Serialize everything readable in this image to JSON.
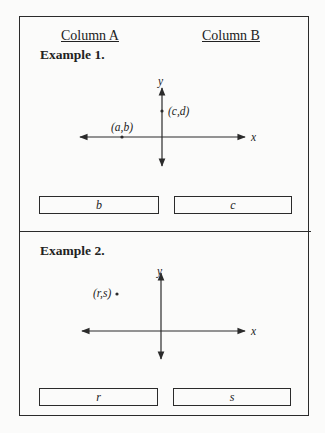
{
  "header": {
    "column_a": "Column A",
    "column_b": "Column B"
  },
  "examples": [
    {
      "title": "Example 1.",
      "graph": {
        "x_axis_label": "x",
        "y_axis_label": "y",
        "points": [
          {
            "label": "(a,b)",
            "location": "on negative x-axis"
          },
          {
            "label": "(c,d)",
            "location": "on positive y-axis"
          }
        ]
      },
      "column_a_value": "b",
      "column_b_value": "c"
    },
    {
      "title": "Example 2.",
      "graph": {
        "x_axis_label": "x",
        "y_axis_label": "y",
        "points": [
          {
            "label": "(r,s)",
            "location": "second quadrant"
          }
        ]
      },
      "column_a_value": "r",
      "column_b_value": "s"
    }
  ],
  "colors": {
    "ink": "#2b2b2b",
    "paper": "#fbfbfa"
  }
}
